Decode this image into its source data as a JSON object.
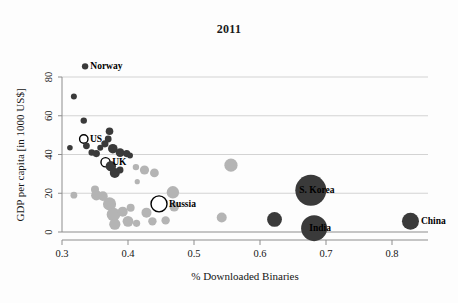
{
  "chart_data": {
    "type": "scatter",
    "title": "2011",
    "xlabel": "% Downloaded Binaries",
    "ylabel": "GDP per capita [in 1000 US$]",
    "xlim": [
      0.28,
      0.86
    ],
    "ylim": [
      0,
      88
    ],
    "xticks": [
      0.3,
      0.4,
      0.5,
      0.6,
      0.7,
      0.8
    ],
    "xtick_labels": [
      "0.3",
      "0.4",
      "0.5",
      "0.6",
      "0.7",
      "0.8"
    ],
    "yticks": [
      0,
      20,
      40,
      60,
      80
    ],
    "ytick_labels": [
      "0",
      "20",
      "40",
      "60",
      "80"
    ],
    "grid": "horizontal",
    "legend": "none",
    "colors": {
      "dark_bubble": "#3a3a3a",
      "light_bubble": "#b4b4b4",
      "highlight_outline": "#000000",
      "gridline": "#d3d3d3",
      "axis": "#8d8d8d",
      "text": "#151515"
    },
    "note": "Bubble area encodes country size; dark bubbles and light-gray bubbles are two groups. Labeled countries drawn as open (unfilled) circles except S. Korea, India and China which are filled dark.",
    "points": [
      {
        "label": "Norway",
        "x": 0.335,
        "y": 85.5,
        "r": 3.2,
        "style": "dark",
        "label_pos": "right"
      },
      {
        "label": "",
        "x": 0.318,
        "y": 70.0,
        "r": 3.0,
        "style": "dark"
      },
      {
        "label": "",
        "x": 0.333,
        "y": 57.5,
        "r": 3.2,
        "style": "dark"
      },
      {
        "label": "US",
        "x": 0.333,
        "y": 48.0,
        "r": 4.2,
        "style": "open-dark",
        "label_pos": "right"
      },
      {
        "label": "",
        "x": 0.312,
        "y": 43.5,
        "r": 2.8,
        "style": "dark"
      },
      {
        "label": "",
        "x": 0.337,
        "y": 44.5,
        "r": 3.4,
        "style": "dark"
      },
      {
        "label": "",
        "x": 0.345,
        "y": 41.0,
        "r": 3.2,
        "style": "dark"
      },
      {
        "label": "",
        "x": 0.352,
        "y": 40.5,
        "r": 3.6,
        "style": "dark"
      },
      {
        "label": "",
        "x": 0.358,
        "y": 43.5,
        "r": 3.0,
        "style": "dark"
      },
      {
        "label": "",
        "x": 0.365,
        "y": 45.5,
        "r": 3.6,
        "style": "dark"
      },
      {
        "label": "",
        "x": 0.372,
        "y": 52.0,
        "r": 3.8,
        "style": "dark"
      },
      {
        "label": "",
        "x": 0.37,
        "y": 48.0,
        "r": 3.4,
        "style": "dark"
      },
      {
        "label": "",
        "x": 0.377,
        "y": 43.0,
        "r": 4.8,
        "style": "dark"
      },
      {
        "label": "",
        "x": 0.388,
        "y": 41.0,
        "r": 4.4,
        "style": "dark"
      },
      {
        "label": "",
        "x": 0.398,
        "y": 40.5,
        "r": 3.6,
        "style": "dark"
      },
      {
        "label": "",
        "x": 0.403,
        "y": 39.5,
        "r": 3.0,
        "style": "dark"
      },
      {
        "label": "UK",
        "x": 0.366,
        "y": 36.0,
        "r": 4.6,
        "style": "open-dark",
        "label_pos": "right"
      },
      {
        "label": "",
        "x": 0.374,
        "y": 34.0,
        "r": 5.2,
        "style": "dark"
      },
      {
        "label": "",
        "x": 0.38,
        "y": 30.5,
        "r": 5.0,
        "style": "dark"
      },
      {
        "label": "",
        "x": 0.388,
        "y": 32.0,
        "r": 3.4,
        "style": "dark"
      },
      {
        "label": "",
        "x": 0.412,
        "y": 33.5,
        "r": 3.2,
        "style": "light"
      },
      {
        "label": "",
        "x": 0.425,
        "y": 32.0,
        "r": 4.6,
        "style": "light"
      },
      {
        "label": "",
        "x": 0.414,
        "y": 26.0,
        "r": 2.6,
        "style": "light"
      },
      {
        "label": "",
        "x": 0.44,
        "y": 30.5,
        "r": 4.4,
        "style": "light"
      },
      {
        "label": "",
        "x": 0.318,
        "y": 19.0,
        "r": 3.4,
        "style": "light"
      },
      {
        "label": "",
        "x": 0.35,
        "y": 22.0,
        "r": 4.0,
        "style": "light"
      },
      {
        "label": "",
        "x": 0.352,
        "y": 19.0,
        "r": 5.2,
        "style": "light"
      },
      {
        "label": "",
        "x": 0.362,
        "y": 18.5,
        "r": 4.8,
        "style": "light"
      },
      {
        "label": "",
        "x": 0.372,
        "y": 14.5,
        "r": 6.6,
        "style": "light"
      },
      {
        "label": "",
        "x": 0.378,
        "y": 9.0,
        "r": 6.8,
        "style": "light"
      },
      {
        "label": "",
        "x": 0.38,
        "y": 4.0,
        "r": 5.6,
        "style": "light"
      },
      {
        "label": "",
        "x": 0.392,
        "y": 10.5,
        "r": 5.0,
        "style": "light"
      },
      {
        "label": "",
        "x": 0.4,
        "y": 5.5,
        "r": 5.4,
        "style": "light"
      },
      {
        "label": "",
        "x": 0.404,
        "y": 12.5,
        "r": 4.0,
        "style": "light"
      },
      {
        "label": "",
        "x": 0.413,
        "y": 4.5,
        "r": 3.6,
        "style": "light"
      },
      {
        "label": "",
        "x": 0.428,
        "y": 10.0,
        "r": 5.0,
        "style": "light"
      },
      {
        "label": "",
        "x": 0.437,
        "y": 5.5,
        "r": 4.2,
        "style": "light"
      },
      {
        "label": "",
        "x": 0.457,
        "y": 6.0,
        "r": 4.2,
        "style": "light"
      },
      {
        "label": "",
        "x": 0.468,
        "y": 20.5,
        "r": 6.2,
        "style": "light"
      },
      {
        "label": "",
        "x": 0.47,
        "y": 13.0,
        "r": 4.8,
        "style": "light"
      },
      {
        "label": "Russia",
        "x": 0.447,
        "y": 14.5,
        "r": 8.0,
        "style": "open-light",
        "label_pos": "right"
      },
      {
        "label": "",
        "x": 0.542,
        "y": 7.5,
        "r": 5.0,
        "style": "light"
      },
      {
        "label": "",
        "x": 0.556,
        "y": 34.5,
        "r": 6.6,
        "style": "light"
      },
      {
        "label": "",
        "x": 0.622,
        "y": 6.5,
        "r": 7.4,
        "style": "dark"
      },
      {
        "label": "S. Korea",
        "x": 0.677,
        "y": 21.5,
        "r": 15.5,
        "style": "dark",
        "label_pos": "center"
      },
      {
        "label": "India",
        "x": 0.682,
        "y": 2.0,
        "r": 13.0,
        "style": "dark",
        "label_pos": "center"
      },
      {
        "label": "China",
        "x": 0.828,
        "y": 5.5,
        "r": 8.5,
        "style": "dark",
        "label_pos": "right"
      }
    ]
  }
}
